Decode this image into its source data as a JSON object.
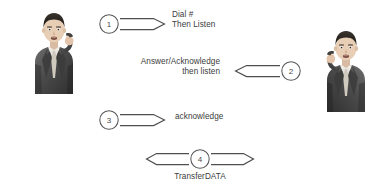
{
  "diagram": {
    "background_color": "#ffffff",
    "line_color": "#4f4f4f",
    "text_color": "#3c3c3c"
  },
  "actors": [
    {
      "id": "caller",
      "name": "man-on-phone-left",
      "description": "Man in dark suit holding telephone handset to left ear",
      "side": "left"
    },
    {
      "id": "callee",
      "name": "man-on-phone-right",
      "description": "Man in dark suit holding telephone handset to right ear, mirrored",
      "side": "right"
    }
  ],
  "steps": [
    {
      "number": "1",
      "direction": "left-to-right",
      "label_lines": [
        "Dial #",
        "Then Listen"
      ],
      "label_align": "left"
    },
    {
      "number": "2",
      "direction": "right-to-left",
      "label_lines": [
        "Answer/Acknowledge",
        "then listen"
      ],
      "label_align": "right"
    },
    {
      "number": "3",
      "direction": "left-to-right",
      "label_lines": [
        "acknowledge"
      ],
      "label_align": "left"
    },
    {
      "number": "4",
      "direction": "bidirectional",
      "label_lines": [
        "TransferDATA"
      ],
      "label_align": "center"
    }
  ]
}
